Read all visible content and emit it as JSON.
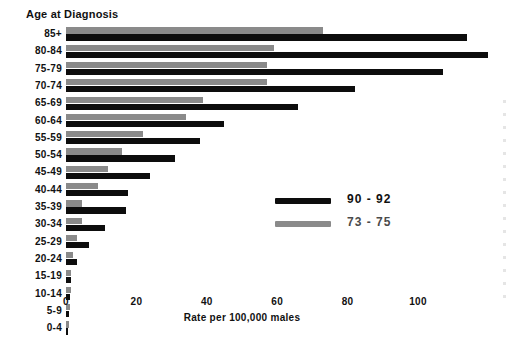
{
  "chart_data": {
    "type": "bar",
    "orientation": "horizontal",
    "title": "Age at Diagnosis",
    "xlabel": "Rate per 100,000 males",
    "ylabel": "Age at Diagnosis",
    "xlim": [
      0,
      112
    ],
    "xticks": [
      0,
      20,
      40,
      60,
      80,
      100
    ],
    "xtick_labels": [
      "0",
      "20",
      "40",
      "60",
      "80",
      "100"
    ],
    "grid": false,
    "legend_position": "center-right",
    "categories": [
      "85+",
      "80-84",
      "75-79",
      "70-74",
      "65-69",
      "60-64",
      "55-59",
      "50-54",
      "45-49",
      "40-44",
      "35-39",
      "30-34",
      "25-29",
      "20-24",
      "15-19",
      "10-14",
      "5-9",
      "0-4"
    ],
    "series": [
      {
        "name": "90 - 92",
        "color": "#0d0d0d",
        "values": [
          114,
          120,
          107,
          82,
          66,
          45,
          38,
          31,
          24,
          17.5,
          17,
          11,
          6.5,
          3,
          1.3,
          1,
          0.9,
          0.6
        ]
      },
      {
        "name": "73 - 75",
        "color": "#8a8a8a",
        "values": [
          73,
          59,
          57,
          57,
          39,
          34,
          22,
          16,
          12,
          9,
          4.5,
          4.5,
          3,
          2,
          1.5,
          1.3,
          1.2,
          0.8
        ]
      }
    ]
  },
  "legend": {
    "entries": [
      {
        "label": "90 - 92",
        "swatch": "black"
      },
      {
        "label": "73 - 75",
        "swatch": "gray"
      }
    ]
  },
  "axis": {
    "x_title": "Rate per 100,000 males"
  }
}
